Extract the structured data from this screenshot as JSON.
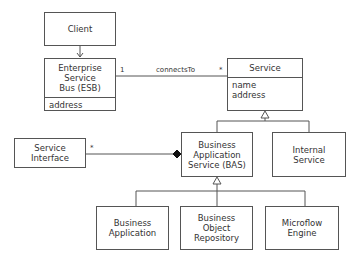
{
  "classes": {
    "client": {
      "name": "Client"
    },
    "esb": {
      "name": "Enterprise\nService\nBus (ESB)",
      "attributes": "address"
    },
    "service": {
      "name": "Service",
      "attributes": "name\naddress"
    },
    "service_interface": {
      "name": "Service\nInterface"
    },
    "bas": {
      "name": "Business\nApplication\nService (BAS)"
    },
    "internal_service": {
      "name": "Internal\nService"
    },
    "business_application": {
      "name": "Business\nApplication"
    },
    "business_object_repository": {
      "name": "Business\nObject\nRepository"
    },
    "microflow_engine": {
      "name": "Microflow\nEngine"
    }
  },
  "associations": {
    "connects": {
      "label": "connectsTo",
      "source_mult": "1",
      "target_mult": "*"
    },
    "composition": {
      "mult": "*"
    }
  },
  "colors": {
    "line": "#555555",
    "text": "#333333"
  }
}
